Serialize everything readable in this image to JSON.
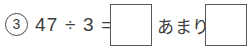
{
  "problem": {
    "number_label": "3",
    "equation": "47 ÷ 3 =",
    "dividend": 47,
    "divisor": 3,
    "operator": "÷",
    "equals": "=",
    "remainder_label": "あまり",
    "quotient_answer": "",
    "remainder_answer": ""
  },
  "colors": {
    "ink": "#3c3c3c",
    "box_border": "#585858",
    "circle_border": "#4a4a4a",
    "page_background": "#ffffff"
  }
}
